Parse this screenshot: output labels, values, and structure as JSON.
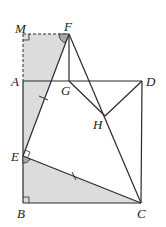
{
  "diagram": {
    "type": "geometry",
    "colors": {
      "line": "#2a2a2a",
      "shade": "#d9d9d9",
      "angle_shade": "#a9a9a9"
    },
    "points": {
      "M": {
        "label": "M",
        "x": 23,
        "y": 34
      },
      "F": {
        "label": "F",
        "x": 69,
        "y": 34
      },
      "A": {
        "label": "A",
        "x": 23,
        "y": 81
      },
      "G": {
        "label": "G",
        "x": 69,
        "y": 81
      },
      "D": {
        "label": "D",
        "x": 142,
        "y": 81
      },
      "H": {
        "label": "H",
        "x": 105,
        "y": 116
      },
      "E": {
        "label": "E",
        "x": 23,
        "y": 156
      },
      "B": {
        "label": "B",
        "x": 23,
        "y": 203
      },
      "C": {
        "label": "C",
        "x": 141,
        "y": 203
      }
    },
    "segments": [
      "AD",
      "DC",
      "CB",
      "BA",
      "FG",
      "FC",
      "FE",
      "EC",
      "GC",
      "DH",
      "MF (dashed)",
      "MA (dashed)"
    ],
    "shaded_regions": [
      "trapezoid MFEA",
      "triangle EBC"
    ],
    "markers": [
      "right angle at M",
      "right angle at B",
      "right angle at E",
      "angle at F",
      "angle at E",
      "tick on EF",
      "tick on EC"
    ]
  }
}
